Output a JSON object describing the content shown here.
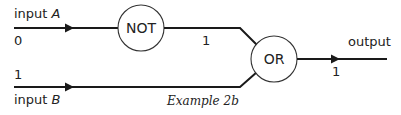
{
  "diagram": {
    "caption": "Example 2b",
    "inputs": [
      {
        "label_prefix": "input ",
        "label_var": "A",
        "value": "0"
      },
      {
        "label_prefix": "input ",
        "label_var": "B",
        "value": "1"
      }
    ],
    "gates": [
      {
        "name": "NOT",
        "output_value": "1"
      },
      {
        "name": "OR",
        "output_value": "1"
      }
    ],
    "output": {
      "label": "output",
      "value": "1"
    },
    "colors": {
      "line": "#1a1a1a",
      "gate_stroke": "#333333",
      "background": "#ffffff"
    }
  }
}
